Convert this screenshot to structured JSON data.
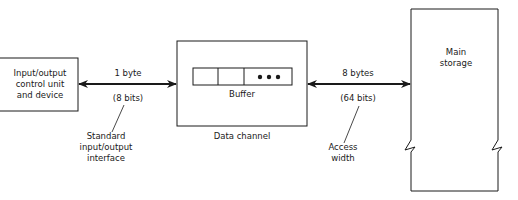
{
  "diagram": {
    "io_unit": {
      "label_lines": [
        "Input/output",
        "control unit",
        "and device"
      ]
    },
    "link_io_channel": {
      "width_label": "1 byte",
      "bits_label": "(8 bits)",
      "annotation_lines": [
        "Standard",
        "input/output",
        "interface"
      ]
    },
    "data_channel": {
      "caption": "Data channel",
      "buffer_label": "Buffer",
      "buffer_cells": 3,
      "ellipsis": "• • •"
    },
    "link_channel_storage": {
      "width_label": "8 bytes",
      "bits_label": "(64 bits)",
      "annotation_lines": [
        "Access",
        "width"
      ]
    },
    "main_storage": {
      "label_lines": [
        "Main",
        "storage"
      ]
    }
  }
}
